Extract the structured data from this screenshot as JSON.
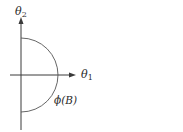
{
  "diagram": {
    "axes": {
      "x_label": {
        "symbol": "θ",
        "subscript": "1"
      },
      "y_label": {
        "symbol": "θ",
        "subscript": "2"
      }
    },
    "curve": {
      "type": "semicircle",
      "label": "ϕ(B)",
      "side": "right"
    },
    "colors": {
      "stroke": "#3a3a3a",
      "background": "#ffffff"
    }
  }
}
